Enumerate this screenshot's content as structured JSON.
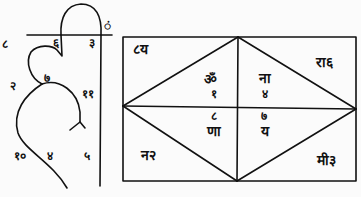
{
  "figure": {
    "type": "devanagari-diagram",
    "left_glyph": {
      "numbers": {
        "top_left": "८",
        "top_mid": "६",
        "top_right": "३",
        "mark": "ं",
        "left_upper": "२",
        "center": "७",
        "right_upper": "११",
        "left_lower": "१०",
        "center_lower": "४",
        "right_lower": "५"
      }
    },
    "grid_chart": {
      "corners": {
        "top_left": "८य",
        "top_right": "रा६",
        "bottom_left": "न२",
        "bottom_right": "मी३"
      },
      "center": {
        "top_left_syllable": "ॐ",
        "top_left_number": "१",
        "top_right_syllable": "ना",
        "top_right_number": "४",
        "bottom_left_number": "८",
        "bottom_left_syllable": "णा",
        "bottom_right_number": "७",
        "bottom_right_syllable": "य"
      }
    },
    "colors": {
      "ink": "#111111",
      "paper": "#fbfbfb"
    }
  }
}
